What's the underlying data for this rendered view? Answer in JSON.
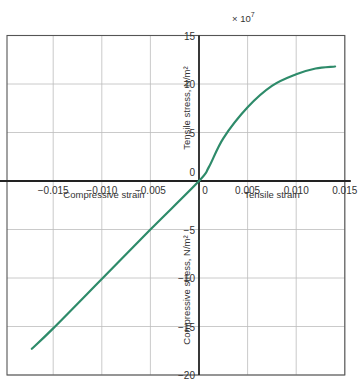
{
  "chart_data": {
    "type": "line",
    "title": "",
    "multiplier_label": "× 10",
    "multiplier_exponent": "7",
    "x_axis": {
      "positive_label": "Tensile strain",
      "negative_label": "Compressive strain",
      "range": [
        -0.0175,
        0.015
      ],
      "ticks": [
        -0.015,
        -0.01,
        -0.005,
        0,
        0.005,
        0.01,
        0.015
      ],
      "tick_labels": [
        "−0.015",
        "−0.010",
        "−0.005",
        "0",
        "0.005",
        "0.010",
        "0.015"
      ]
    },
    "y_axis": {
      "positive_label": "Tensile stress, N/m²",
      "negative_label": "Compressive stress, N/m²",
      "range": [
        -20,
        15
      ],
      "ticks": [
        15,
        10,
        5,
        0,
        -5,
        -10,
        -15,
        -20
      ],
      "tick_labels": [
        "15",
        "10",
        "5",
        "0",
        "−5",
        "−10",
        "−15",
        "−20"
      ]
    },
    "grid": true,
    "series": [
      {
        "name": "Stress-strain curve",
        "color": "#2e8b6a",
        "x": [
          -0.0172,
          -0.015,
          -0.01,
          -0.005,
          0,
          0.001,
          0.0025,
          0.005,
          0.0075,
          0.01,
          0.012,
          0.014
        ],
        "y": [
          -17.3,
          -15.2,
          -10.1,
          -5.0,
          0,
          1.4,
          4.4,
          7.6,
          9.8,
          11.0,
          11.6,
          11.8
        ]
      }
    ]
  }
}
